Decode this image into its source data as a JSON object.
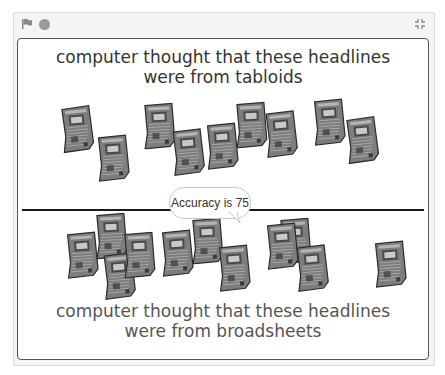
{
  "player": {
    "controls": {
      "green_flag_icon": "flag-icon",
      "stop_icon": "stop-icon",
      "fullscreen_icon": "fullscreen-icon"
    }
  },
  "stage": {
    "top_caption_line1": "computer thought that these headlines",
    "top_caption_line2": "were from  tabloids",
    "bottom_caption_line1": "computer thought that these headlines",
    "bottom_caption_line2": "were from  broadsheets",
    "speech_bubble": "Accuracy is 75",
    "tabloid_sprites": [
      {
        "x": 42,
        "y": 67,
        "r": -6
      },
      {
        "x": 78,
        "y": 96,
        "r": -4
      },
      {
        "x": 124,
        "y": 64,
        "r": -3
      },
      {
        "x": 153,
        "y": 90,
        "r": -5
      },
      {
        "x": 187,
        "y": 84,
        "r": -4
      },
      {
        "x": 216,
        "y": 63,
        "r": -3
      },
      {
        "x": 246,
        "y": 72,
        "r": -5
      },
      {
        "x": 294,
        "y": 60,
        "r": -4
      },
      {
        "x": 327,
        "y": 78,
        "r": -6
      }
    ],
    "broadsheet_sprites": [
      {
        "x": 47,
        "y": 193,
        "r": -4
      },
      {
        "x": 76,
        "y": 174,
        "r": -3
      },
      {
        "x": 84,
        "y": 214,
        "r": -5
      },
      {
        "x": 104,
        "y": 193,
        "r": -3
      },
      {
        "x": 142,
        "y": 191,
        "r": -4
      },
      {
        "x": 172,
        "y": 179,
        "r": -3
      },
      {
        "x": 199,
        "y": 206,
        "r": -4
      },
      {
        "x": 260,
        "y": 179,
        "r": -3
      },
      {
        "x": 247,
        "y": 184,
        "r": -4
      },
      {
        "x": 277,
        "y": 206,
        "r": -5
      },
      {
        "x": 355,
        "y": 202,
        "r": -4
      }
    ]
  }
}
